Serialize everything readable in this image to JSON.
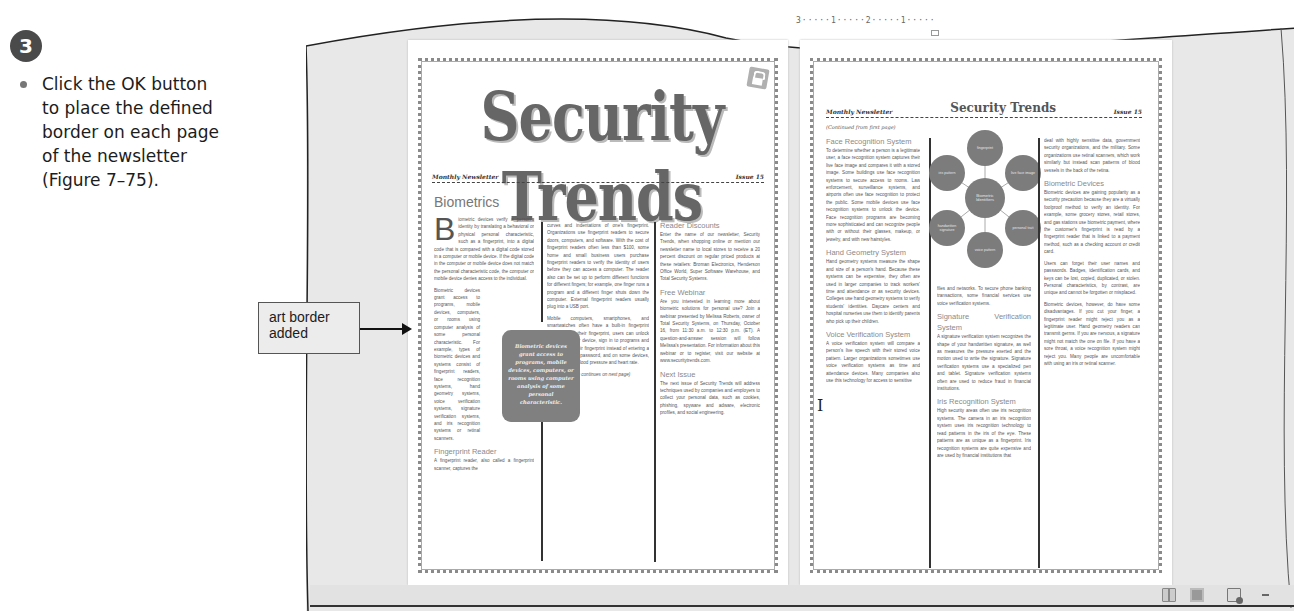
{
  "instruction": {
    "step_number": "3",
    "text": "Click the OK button to place the defined border on each page of the newsletter (Figure 7–75)."
  },
  "callout": {
    "label": "art border added"
  },
  "ruler": {
    "text": "3·····1·····2·····1·····"
  },
  "page1": {
    "masthead": "Security Trends",
    "subtitle_left": "Monthly Newsletter",
    "subtitle_right": "Issue 15",
    "section_title": "Biometrics",
    "dropcap": "B",
    "col1": [
      "iometric devices verify a person's identity by translating a behavioral or physical personal characteristic, such as a fingerprint, into a digital code that is compared with a digital code stored in a computer or mobile device. If the digital code in the computer or mobile device does not match the personal characteristic code, the computer or mobile device denies access to the individual.",
      "Biometric devices grant access to programs, mobile devices, computers, or rooms using computer analysis of some personal characteristic. For example, types of biometric devices and systems consist of fingerprint readers, face recognition systems, hand geometry systems, voice verification systems, signature verification systems, and iris recognition systems or retinal scanners."
    ],
    "col1_heading2": "Fingerprint Reader",
    "col1_text2": "A fingerprint reader, also called a fingerprint scanner, captures the",
    "col2": [
      "curves and indentations of one's fingerprint. Organizations use fingerprint readers to secure doors, computers, and software. With the cost of fingerprint readers often less than $100, some home and small business users purchase fingerprint readers to verify the identity of users before they can access a computer. The reader also can be set up to perform different functions for different fingers; for example, one finger runs a program and a different finger shuts down the computer. External fingerprint readers usually plug into a USB port.",
      "Mobile computers, smartphones, and smartwatches often have a built-in fingerprint reader. Using their fingerprint, users can unlock the computer or device, sign in to programs and websites via their fingerprint instead of entering a user name and password, and on some devices, even test their blood pressure and heart rate."
    ],
    "col2_footer": "(Article continues on next page)",
    "col3_h1": "Reader Discounts",
    "col3_t1": "Enter the name of our newsletter, Security Trends, when shopping online or mention our newsletter name to local stores to receive a 20 percent discount on regular priced products at these retailers: Broman Electronics, Henderson Office World, Super Software Warehouse, and Total Security Systems.",
    "col3_h2": "Free Webinar",
    "col3_t2": "Are you interested in learning more about biometric solutions for personal use? Join a webinar presented by Melissa Roberts, owner of Total Security Systems, on Thursday, October 16, from 11:30 a.m. to 12:30 p.m. (ET). A question-and-answer session will follow Melissa's presentation. For information about this webinar or to register, visit our website at www.securitytrends.com.",
    "col3_h3": "Next Issue",
    "col3_t3": "The next issue of Security Trends will address techniques used by companies and employers to collect your personal data, such as cookies, phishing, spyware and adware, electronic profiles, and social engineering.",
    "pullquote": "Biometric devices grant access to programs, mobile devices, computers, or rooms using computer analysis of some personal characteristic."
  },
  "page2": {
    "header_left": "Monthly Newsletter",
    "header_center": "Security Trends",
    "header_right": "Issue 15",
    "continued": "(Continued from first page)",
    "col1_h1": "Face Recognition System",
    "col1_t1": "To determine whether a person is a legitimate user, a face recognition system captures their live face image and compares it with a stored image. Some buildings use face recognition systems to secure access to rooms. Law enforcement, surveillance systems, and airports often use face recognition to protect the public. Some mobile devices use face recognition systems to unlock the device. Face recognition programs are becoming more sophisticated and can recognize people with or without their glasses, makeup, or jewelry, and with new hairstyles.",
    "col1_h2": "Hand Geometry System",
    "col1_t2": "Hand geometry systems measure the shape and size of a person's hand. Because these systems can be expensive, they often are used in larger companies to track workers' time and attendance or as security devices. Colleges use hand geometry systems to verify students' identities. Daycare centers and hospital nurseries use them to identify parents who pick up their children.",
    "col1_h3": "Voice Verification System",
    "col1_t3": "A voice verification system will compare a person's live speech with their stored voice pattern. Larger organizations sometimes use voice verification systems as time and attendance devices. Many companies also use this technology for access to sensitive",
    "col2_t0": "files and networks. To secure phone banking transactions, some financial services use voice verification systems.",
    "col2_h1": "Signature Verification System",
    "col2_t1": "A signature verification system recognizes the shape of your handwritten signature, as well as measures the pressure exerted and the motion used to write the signature. Signature verification systems use a specialized pen and tablet. Signature verification systems often are used to reduce fraud in financial institutions.",
    "col2_h2": "Iris Recognition System",
    "col2_t2": "High security areas often use iris recognition systems. The camera in an iris recognition system uses iris recognition technology to read patterns in the iris of the eye. These patterns are as unique as a fingerprint. Iris recognition systems are quite expensive and are used by financial institutions that",
    "col3_t0": "deal with highly sensitive data, government security organizations, and the military. Some organizations use retinal scanners, which work similarly but instead scan patterns of blood vessels in the back of the retina.",
    "col3_h1": "Biometric Devices",
    "col3_t1": "Biometric devices are gaining popularity as a security precaution because they are a virtually foolproof method to verify an identity. For example, some grocery stores, retail stores, and gas stations use biometric payment, where the customer's fingerprint is read by a fingerprint reader that is linked to a payment method, such as a checking account or credit card.",
    "col3_t2": "Users can forget their user names and passwords. Badges, identification cards, and keys can be lost, copied, duplicated, or stolen. Personal characteristics, by contrast, are unique and cannot be forgotten or misplaced.",
    "col3_t3": "Biometric devices, however, do have some disadvantages. If you cut your finger, a fingerprint reader might reject you as a legitimate user. Hand geometry readers can transmit germs. If you are nervous, a signature might not match the one on file. If you have a sore throat, a voice recognition system might reject you. Many people are uncomfortable with using an iris or retinal scanner.",
    "smartart": {
      "center": "Biometric Identifiers",
      "nodes": [
        "fingerprint",
        "live face image",
        "personal trait",
        "voice pattern",
        "handwritten signature",
        "iris pattern"
      ]
    }
  },
  "statusbar": {
    "icons": [
      "read-mode-icon",
      "print-layout-icon",
      "web-layout-icon",
      "zoom-out-icon"
    ]
  }
}
